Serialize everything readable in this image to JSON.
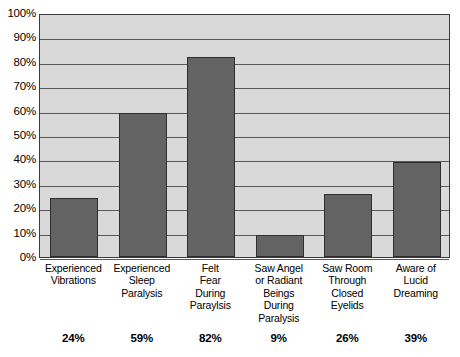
{
  "chart_data": {
    "type": "bar",
    "title": "",
    "xlabel": "",
    "ylabel": "",
    "ylim": [
      0,
      100
    ],
    "grid": true,
    "legend": "none",
    "orientation": "vertical",
    "categories": [
      "Experienced Vibrations",
      "Experienced Sleep Paralysis",
      "Felt Fear During Paraylsis",
      "Saw Angel or Radiant Beings During Paralysis",
      "Saw Room Through Closed Eyelids",
      "Aware of Lucid Dreaming"
    ],
    "category_lines": [
      [
        "Experienced",
        "Vibrations"
      ],
      [
        "Experienced",
        "Sleep",
        "Paralysis"
      ],
      [
        "Felt",
        "Fear",
        "During",
        "Paraylsis"
      ],
      [
        "Saw Angel",
        "or Radiant",
        "Beings",
        "During",
        "Paralysis"
      ],
      [
        "Saw Room",
        "Through",
        "Closed",
        "Eyelids"
      ],
      [
        "Aware of",
        "Lucid",
        "Dreaming"
      ]
    ],
    "values": [
      24,
      59,
      82,
      9,
      26,
      39
    ],
    "value_labels": [
      "24%",
      "59%",
      "82%",
      "9%",
      "26%",
      "39%"
    ],
    "ytick_values": [
      0,
      10,
      20,
      30,
      40,
      50,
      60,
      70,
      80,
      90,
      100
    ],
    "ytick_labels": [
      "0%",
      "10%",
      "20%",
      "30%",
      "40%",
      "50%",
      "60%",
      "70%",
      "80%",
      "90%",
      "100%"
    ],
    "colors": {
      "bar_fill": "#636363",
      "bar_border": "#2e2e2e",
      "plot_background": "#d9d9d9",
      "gridline": "#585858",
      "axis_border": "#3a3a3a",
      "text": "#000000",
      "page_background": "#ffffff"
    }
  }
}
